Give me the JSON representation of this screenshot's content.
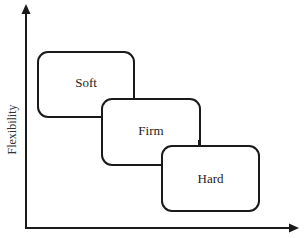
{
  "diagram": {
    "type": "overlapping-categories-on-axes",
    "y_axis": {
      "label": "Flexibility",
      "arrow": "up"
    },
    "x_axis": {
      "label": "",
      "arrow": "right"
    },
    "boxes": [
      {
        "id": "soft",
        "label": "Soft"
      },
      {
        "id": "firm",
        "label": "Firm"
      },
      {
        "id": "hard",
        "label": "Hard"
      }
    ],
    "colors": {
      "stroke": "#1a1a1a",
      "fill": "#ffffff",
      "text": "#222222"
    }
  }
}
